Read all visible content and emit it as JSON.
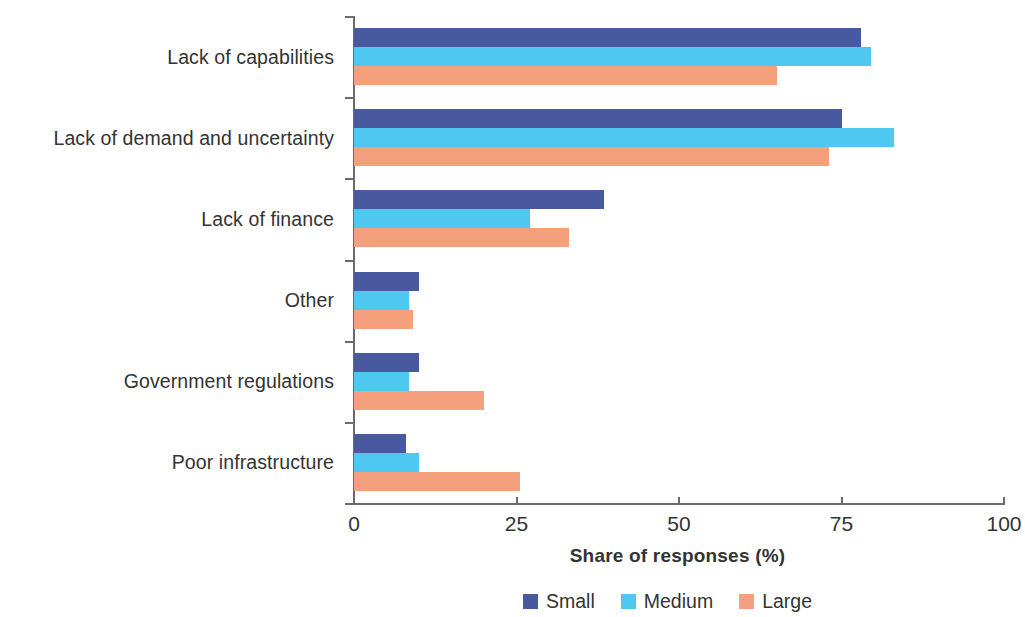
{
  "chart_data": {
    "type": "bar",
    "orientation": "horizontal",
    "title": "",
    "xlabel": "Share of responses (%)",
    "ylabel": "",
    "xlim": [
      0,
      100
    ],
    "xticks": [
      "0",
      "25",
      "50",
      "75",
      "100"
    ],
    "grid": false,
    "legend_position": "bottom",
    "categories": [
      "Lack of capabilities",
      "Lack of demand and uncertainty",
      "Lack of finance",
      "Other",
      "Government regulations",
      "Poor infrastructure"
    ],
    "series": [
      {
        "name": "Small",
        "color": "#49599f",
        "values": [
          78,
          75,
          38.5,
          10,
          10,
          8
        ]
      },
      {
        "name": "Medium",
        "color": "#4ec8f0",
        "values": [
          79.5,
          83,
          27,
          8.5,
          8.5,
          10
        ]
      },
      {
        "name": "Large",
        "color": "#f4a07c",
        "values": [
          65,
          73,
          33,
          9,
          20,
          25.5
        ]
      }
    ]
  },
  "axis": {
    "x_title": "Share of responses (%)"
  },
  "legend": {
    "items": [
      {
        "label": "Small",
        "color": "#49599f"
      },
      {
        "label": "Medium",
        "color": "#4ec8f0"
      },
      {
        "label": "Large",
        "color": "#f4a07c"
      }
    ]
  }
}
